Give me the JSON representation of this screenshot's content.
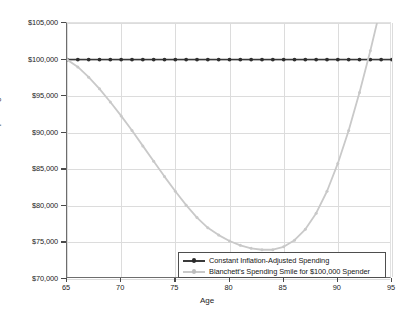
{
  "chart_data": {
    "type": "line",
    "title": "",
    "xlabel": "Age",
    "ylabel": "Real Spending",
    "xlim": [
      65,
      95
    ],
    "ylim": [
      70000,
      105000
    ],
    "xticks": [
      65,
      70,
      75,
      80,
      85,
      90,
      95
    ],
    "yticks": [
      70000,
      75000,
      80000,
      85000,
      90000,
      95000,
      100000,
      105000
    ],
    "xtick_labels": [
      "65",
      "70",
      "75",
      "80",
      "85",
      "90",
      "95"
    ],
    "ytick_labels": [
      "$70,000",
      "$75,000",
      "$80,000",
      "$85,000",
      "$90,000",
      "$95,000",
      "$100,000",
      "$105,000"
    ],
    "grid": true,
    "legend_position": "lower right inside plot",
    "x": [
      65,
      66,
      67,
      68,
      69,
      70,
      71,
      72,
      73,
      74,
      75,
      76,
      77,
      78,
      79,
      80,
      81,
      82,
      83,
      84,
      85,
      86,
      87,
      88,
      89,
      90,
      91,
      92,
      93,
      94,
      95
    ],
    "series": [
      {
        "name": "Constant Inflation-Adjusted Spending",
        "color": "#3a3a3a",
        "marker": "circle",
        "values": [
          100000,
          100000,
          100000,
          100000,
          100000,
          100000,
          100000,
          100000,
          100000,
          100000,
          100000,
          100000,
          100000,
          100000,
          100000,
          100000,
          100000,
          100000,
          100000,
          100000,
          100000,
          100000,
          100000,
          100000,
          100000,
          100000,
          100000,
          100000,
          100000,
          100000,
          100000
        ]
      },
      {
        "name": "Blanchett's Spending Smile for $100,000 Spender",
        "color": "#c9c9c9",
        "marker": "circle",
        "values": [
          100000,
          99000,
          97600,
          96000,
          94200,
          92300,
          90300,
          88200,
          86100,
          84000,
          82000,
          80100,
          78400,
          77000,
          76000,
          75200,
          74600,
          74200,
          74000,
          74000,
          74400,
          75300,
          76800,
          79000,
          82000,
          85800,
          90300,
          95500,
          101200,
          107400,
          114000
        ]
      }
    ]
  },
  "legend": {
    "entries": [
      {
        "label": "Constant Inflation-Adjusted Spending"
      },
      {
        "label": "Blanchett's Spending Smile for $100,000 Spender"
      }
    ]
  }
}
